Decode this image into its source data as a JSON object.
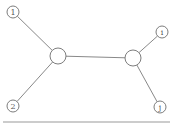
{
  "diagram": {
    "type": "graph",
    "nodes": [
      {
        "id": "n1",
        "label": "1",
        "kind": "leaf"
      },
      {
        "id": "hubL",
        "label": "",
        "kind": "internal"
      },
      {
        "id": "hubR",
        "label": "",
        "kind": "internal"
      },
      {
        "id": "ni",
        "label": "i",
        "kind": "leaf"
      },
      {
        "id": "n2",
        "label": "2",
        "kind": "leaf"
      },
      {
        "id": "nj",
        "label": "j",
        "kind": "leaf"
      }
    ],
    "edges": [
      {
        "from": "n1",
        "to": "hubL"
      },
      {
        "from": "n2",
        "to": "hubL"
      },
      {
        "from": "hubL",
        "to": "hubR"
      },
      {
        "from": "hubR",
        "to": "ni"
      },
      {
        "from": "hubR",
        "to": "nj"
      }
    ],
    "colors": {
      "stroke": "#6e6e6e",
      "edge": "#7a7a7a",
      "text": "#555555",
      "background": "#ffffff"
    }
  }
}
